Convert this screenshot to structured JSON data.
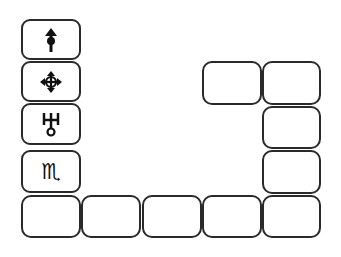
{
  "palette": {
    "tools": [
      {
        "name": "move-up",
        "icon": "up-arrow-circle-icon",
        "glyph": "⇡"
      },
      {
        "name": "move-all",
        "icon": "four-way-arrows-icon",
        "glyph": "✥"
      },
      {
        "name": "uranus",
        "icon": "uranus-symbol-icon",
        "glyph": "♅"
      },
      {
        "name": "scorpio",
        "icon": "scorpio-symbol-icon",
        "glyph": "♏"
      }
    ]
  },
  "board": {
    "slots_count": 9,
    "colors": {
      "border": "#2a2a2a",
      "fill": "#ffffff"
    }
  }
}
